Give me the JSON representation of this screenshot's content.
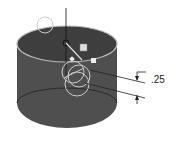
{
  "diagram": {
    "type": "cad-cylinder-with-fillet-dimension",
    "dimension_label": ".25",
    "colors": {
      "body": "#4a4a4a",
      "top_face": "#3c3c3c",
      "edge_highlight": "#c8c8c8",
      "line": "#222222"
    }
  }
}
